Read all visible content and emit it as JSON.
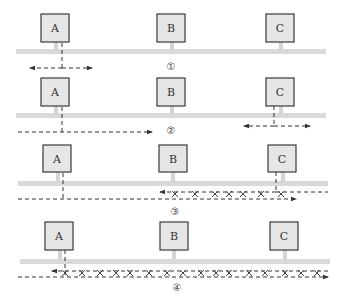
{
  "nodes": [
    "A",
    "B",
    "C"
  ],
  "panels": [
    {
      "id": "1",
      "label": "①",
      "description": "A sends; signal propagates both directions"
    },
    {
      "id": "2",
      "label": "②",
      "description": "A's signal travels right; C begins sending"
    },
    {
      "id": "3",
      "label": "③",
      "description": "Signals from A and C collide between B and C"
    },
    {
      "id": "4",
      "label": "④",
      "description": "Collision propagates back to A"
    }
  ],
  "colors": {
    "box_fill": "#e6e6e6",
    "box_stroke": "#3a3a3a",
    "bus": "#d9d9d9",
    "signal": "#333333"
  }
}
